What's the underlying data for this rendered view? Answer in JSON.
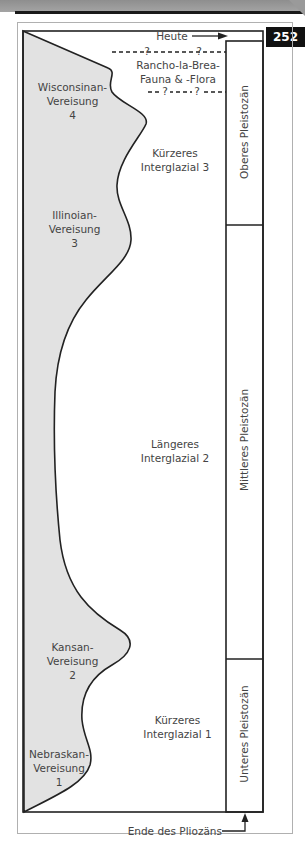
{
  "page": {
    "page_number": "252"
  },
  "diagram": {
    "title_marker_top": "Heute",
    "title_marker_bottom": "Ende des Pliozäns",
    "fauna_label_line1": "Rancho-la-Brea-",
    "fauna_label_line2": "Fauna & -Flora",
    "uncertainty_marker": "?",
    "glaciations": [
      {
        "line1": "Wisconsinan-",
        "line2": "Vereisung",
        "number": "4"
      },
      {
        "line1": "Illinoian-",
        "line2": "Vereisung",
        "number": "3"
      },
      {
        "line1": "Kansan-",
        "line2": "Vereisung",
        "number": "2"
      },
      {
        "line1": "Nebraskan-",
        "line2": "Vereisung",
        "number": "1"
      }
    ],
    "interglacials": [
      {
        "line1": "Kürzeres",
        "line2": "Interglazial 3"
      },
      {
        "line1": "Längeres",
        "line2": "Interglazial 2"
      },
      {
        "line1": "Kürzeres",
        "line2": "Interglazial 1"
      }
    ],
    "epochs": [
      {
        "label": "Oberes Pleistozän"
      },
      {
        "label": "Mittleres Pleistozän"
      },
      {
        "label": "Unteres Pleistozän"
      }
    ],
    "colors": {
      "ice_fill": "#e2e2e2",
      "line": "#222222",
      "text": "#444444",
      "badge_bg": "#111111"
    }
  }
}
